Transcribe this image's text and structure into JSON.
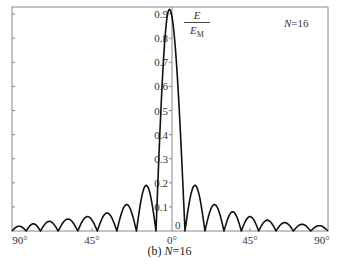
{
  "chart_data": {
    "type": "line",
    "title": "",
    "caption": "(b) N=16",
    "caption_prefix": "(b) ",
    "caption_var": "N",
    "caption_value": "=16",
    "legend_label": "N=16",
    "legend_var": "N",
    "legend_value": "=16",
    "ylabel_num": "E",
    "ylabel_den": "E",
    "ylabel_den_sub": "M",
    "xlabel": "",
    "x_tick_labels": [
      "90°",
      "45°",
      "0°",
      "45°",
      "90°"
    ],
    "x_tick_values": [
      -90,
      -45,
      0,
      45,
      90
    ],
    "y_tick_labels": [
      "0",
      "0.1",
      "0.2",
      "0.3",
      "0.4",
      "0.5",
      "0.6",
      "0.7",
      "0.8",
      "0.9"
    ],
    "y_tick_values": [
      0,
      0.1,
      0.2,
      0.3,
      0.4,
      0.5,
      0.6,
      0.7,
      0.8,
      0.9
    ],
    "xlim": [
      -90,
      90
    ],
    "ylim": [
      0,
      0.93
    ],
    "grid": false,
    "series": [
      {
        "name": "normalized array factor E/EM, N=16",
        "description": "Main lobe peak ~0.92 at 0°, first nulls at about ±7°; symmetric side lobes decreasing toward ±90°",
        "main_lobe": {
          "peak_x": -1.5,
          "peak_y": 0.92,
          "null_left": -9,
          "null_right": 7.5
        },
        "side_lobes_right": [
          {
            "x_start": 7.5,
            "x_end": 19,
            "peak": 0.19
          },
          {
            "x_start": 19,
            "x_end": 30,
            "peak": 0.11
          },
          {
            "x_start": 30,
            "x_end": 40,
            "peak": 0.08
          },
          {
            "x_start": 40,
            "x_end": 50,
            "peak": 0.06
          },
          {
            "x_start": 50,
            "x_end": 60,
            "peak": 0.045
          },
          {
            "x_start": 60,
            "x_end": 70,
            "peak": 0.035
          },
          {
            "x_start": 70,
            "x_end": 80,
            "peak": 0.028
          },
          {
            "x_start": 80,
            "x_end": 90,
            "peak": 0.022
          }
        ],
        "side_lobes_left": [
          {
            "x_start": -9,
            "x_end": -20,
            "peak": 0.19
          },
          {
            "x_start": -20,
            "x_end": -31,
            "peak": 0.11
          },
          {
            "x_start": -31,
            "x_end": -42,
            "peak": 0.075
          },
          {
            "x_start": -42,
            "x_end": -53,
            "peak": 0.06
          },
          {
            "x_start": -53,
            "x_end": -64,
            "peak": 0.05
          },
          {
            "x_start": -64,
            "x_end": -74,
            "peak": 0.04
          },
          {
            "x_start": -74,
            "x_end": -82,
            "peak": 0.03
          },
          {
            "x_start": -82,
            "x_end": -90,
            "peak": 0.02
          }
        ]
      }
    ]
  }
}
